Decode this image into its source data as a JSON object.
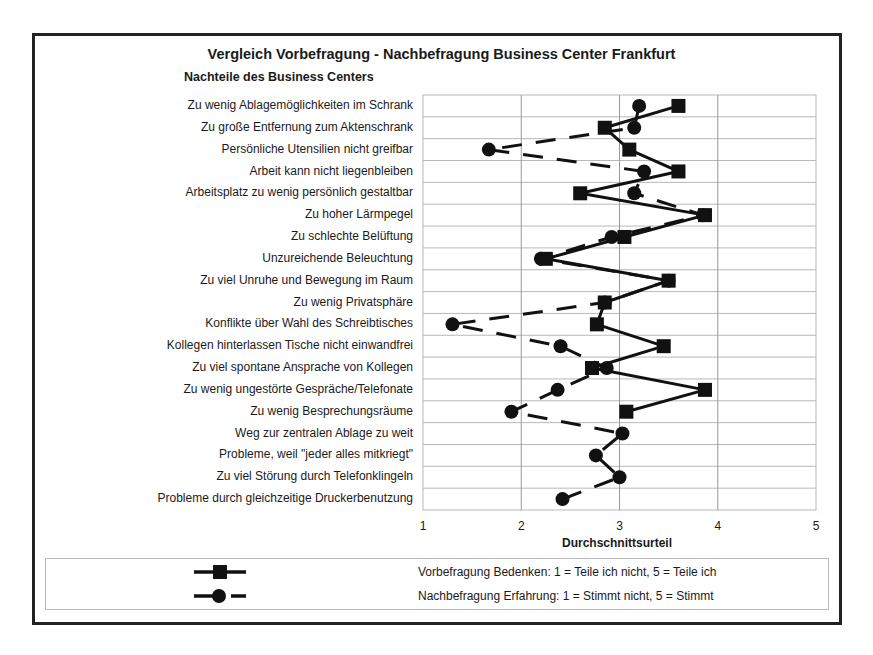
{
  "chart_data": {
    "type": "line",
    "orientation": "horizontal",
    "title": "Vergleich Vorbefragung - Nachbefragung Business Center Frankfurt",
    "subtitle": "Nachteile des Business Centers",
    "xlabel": "Durchschnittsurteil",
    "ylabel": "",
    "xlim": [
      1,
      5
    ],
    "xticks": [
      "1",
      "2",
      "3",
      "4",
      "5"
    ],
    "grid": true,
    "legend_position": "bottom",
    "categories": [
      "Zu wenig Ablagemöglichkeiten im Schrank",
      "Zu große Entfernung zum Aktenschrank",
      "Persönliche Utensilien nicht greifbar",
      "Arbeit kann nicht liegenbleiben",
      "Arbeitsplatz zu wenig persönlich gestaltbar",
      "Zu hoher Lärmpegel",
      "Zu schlechte Belüftung",
      "Unzureichende Beleuchtung",
      "Zu viel Unruhe und Bewegung im Raum",
      "Zu wenig Privatsphäre",
      "Konflikte über Wahl des Schreibtisches",
      "Kollegen hinterlassen Tische nicht einwandfrei",
      "Zu viel spontane Ansprache von Kollegen",
      "Zu wenig ungestörte Gespräche/Telefonate",
      "Zu wenig Besprechungsräume",
      "Weg zur zentralen Ablage zu weit",
      "Probleme, weil \"jeder alles mitkriegt\"",
      "Zu viel Störung durch Telefonklingeln",
      "Probleme durch gleichzeitige Druckerbenutzung"
    ],
    "series": [
      {
        "name": "Vorbefragung Bedenken:  1 = Teile ich nicht, 5 = Teile ich",
        "marker": "square",
        "line": "solid",
        "values": [
          3.6,
          2.85,
          3.1,
          3.6,
          2.6,
          3.87,
          3.05,
          2.25,
          3.5,
          2.85,
          2.77,
          3.45,
          2.72,
          3.87,
          3.07,
          null,
          null,
          null,
          null
        ]
      },
      {
        "name": "Nachbefragung Erfahrung: 1 = Stimmt nicht,  5 = Stimmt",
        "marker": "circle",
        "line": "dashed",
        "values": [
          3.2,
          3.15,
          1.67,
          3.25,
          3.15,
          3.85,
          2.92,
          2.2,
          3.5,
          2.85,
          1.3,
          2.4,
          2.87,
          2.37,
          1.9,
          3.03,
          2.76,
          3.0,
          2.42
        ]
      }
    ]
  },
  "legend": {
    "items": [
      {
        "label": "Vorbefragung Bedenken:  1 = Teile ich nicht, 5 = Teile ich"
      },
      {
        "label": "Nachbefragung Erfahrung: 1 = Stimmt nicht,  5 = Stimmt"
      }
    ]
  },
  "colors": {
    "line": "#111111",
    "grid": "#b8b8b8",
    "frame": "#222222"
  }
}
